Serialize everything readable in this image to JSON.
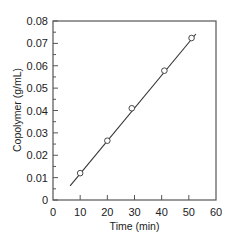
{
  "chart_data": {
    "type": "scatter",
    "title": "",
    "xlabel": "Time (min)",
    "ylabel": "Copolymer (g/mL)",
    "xlim": [
      0,
      60
    ],
    "ylim": [
      0,
      0.08
    ],
    "xticks": [
      0,
      10,
      20,
      30,
      40,
      50,
      60
    ],
    "xtick_labels": [
      "0",
      "10",
      "20",
      "30",
      "40",
      "50",
      "60"
    ],
    "yticks": [
      0,
      0.01,
      0.02,
      0.03,
      0.04,
      0.05,
      0.06,
      0.07,
      0.08
    ],
    "ytick_labels": [
      "0",
      "0.01",
      "0.02",
      "0.03",
      "0.04",
      "0.05",
      "0.06",
      "0.07",
      "0.08"
    ],
    "grid": false,
    "legend": null,
    "series": [
      {
        "name": "Copolymer concentration",
        "marker": "open-circle",
        "x": [
          10,
          20,
          29,
          41,
          51
        ],
        "y": [
          0.012,
          0.0265,
          0.041,
          0.0578,
          0.0724
        ]
      }
    ],
    "fit_line": {
      "name": "Linear fit",
      "x": [
        6.3,
        52.6
      ],
      "y": [
        0.0063,
        0.0742
      ]
    }
  },
  "colors": {
    "axis": "#555555",
    "line": "#333333",
    "marker_edge": "#333333",
    "marker_fill": "#ffffff"
  }
}
